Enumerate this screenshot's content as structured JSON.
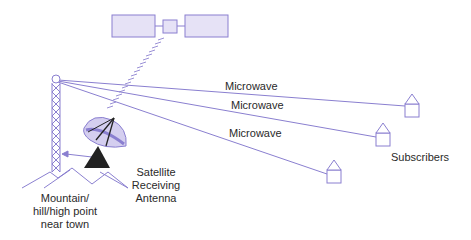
{
  "diagram": {
    "colors": {
      "line": "#8a7fd0",
      "fill": "#e6e2f6",
      "dark": "#222222",
      "text": "#2a2a2a"
    },
    "links": [
      {
        "label": "Microwave"
      },
      {
        "label": "Microwave"
      },
      {
        "label": "Microwave"
      }
    ],
    "subscribers_label": "Subscribers",
    "antenna_label_lines": [
      "Satellite",
      "Receiving",
      "Antenna"
    ],
    "tower_label_lines": [
      "Mountain/",
      "hill/high point",
      "near town"
    ],
    "icons": [
      "satellite-icon",
      "tower-icon",
      "dish-antenna-icon",
      "house-icon",
      "mountain-icon"
    ]
  }
}
